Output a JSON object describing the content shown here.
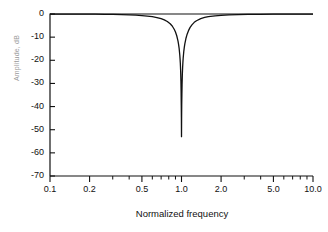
{
  "chart_data": {
    "type": "line",
    "title": "",
    "xlabel": "Normalized frequency",
    "ylabel": "Amplitude, dB",
    "xscale": "log",
    "yscale": "linear",
    "xlim": [
      0.1,
      10.0
    ],
    "ylim": [
      -70,
      0
    ],
    "grid": false,
    "legend": null,
    "xticks": [
      {
        "value": 0.1,
        "label": "0.1"
      },
      {
        "value": 0.2,
        "label": "0.2"
      },
      {
        "value": 0.5,
        "label": "0.5"
      },
      {
        "value": 1.0,
        "label": "1.0"
      },
      {
        "value": 2.0,
        "label": "2.0"
      },
      {
        "value": 5.0,
        "label": "5.0"
      },
      {
        "value": 10.0,
        "label": "10.0"
      }
    ],
    "xminor_ticks": [
      0.3,
      0.4,
      0.6,
      0.7,
      0.8,
      0.9,
      3.0,
      4.0,
      6.0,
      7.0,
      8.0,
      9.0
    ],
    "yticks": [
      {
        "value": 0,
        "label": "0"
      },
      {
        "value": -10,
        "label": "-10"
      },
      {
        "value": -20,
        "label": "-20"
      },
      {
        "value": -30,
        "label": "-30"
      },
      {
        "value": -40,
        "label": "-40"
      },
      {
        "value": -50,
        "label": "-50"
      },
      {
        "value": -60,
        "label": "-60"
      },
      {
        "value": -70,
        "label": "-70"
      }
    ],
    "series": [
      {
        "name": "Notch filter response",
        "color": "#111111",
        "x": [
          0.1,
          0.12,
          0.15,
          0.18,
          0.22,
          0.26,
          0.3,
          0.35,
          0.4,
          0.45,
          0.5,
          0.55,
          0.6,
          0.65,
          0.7,
          0.74,
          0.78,
          0.82,
          0.85,
          0.88,
          0.9,
          0.92,
          0.94,
          0.95,
          0.96,
          0.97,
          0.975,
          0.98,
          0.985,
          0.99,
          0.993,
          0.996,
          0.998,
          1.0,
          1.002,
          1.004,
          1.007,
          1.01,
          1.015,
          1.02,
          1.025,
          1.03,
          1.04,
          1.05,
          1.06,
          1.08,
          1.1,
          1.13,
          1.16,
          1.2,
          1.25,
          1.3,
          1.4,
          1.5,
          1.6,
          1.8,
          2.0,
          2.3,
          2.7,
          3.2,
          4.0,
          5.0,
          6.5,
          8.0,
          10.0
        ],
        "y": [
          -0.02,
          -0.03,
          -0.04,
          -0.06,
          -0.09,
          -0.13,
          -0.18,
          -0.26,
          -0.36,
          -0.49,
          -0.66,
          -0.88,
          -1.16,
          -1.53,
          -2.03,
          -2.55,
          -3.25,
          -4.21,
          -5.2,
          -6.6,
          -7.8,
          -9.4,
          -11.6,
          -13.1,
          -15.0,
          -17.6,
          -19.3,
          -21.5,
          -24.5,
          -29.0,
          -33.5,
          -39.5,
          -44.5,
          -53.0,
          -44.5,
          -39.0,
          -34.5,
          -30.5,
          -26.0,
          -23.0,
          -20.8,
          -19.0,
          -16.4,
          -14.4,
          -12.9,
          -10.6,
          -9.0,
          -7.2,
          -5.9,
          -4.7,
          -3.6,
          -2.9,
          -2.0,
          -1.5,
          -1.15,
          -0.78,
          -0.57,
          -0.39,
          -0.26,
          -0.18,
          -0.12,
          -0.08,
          -0.05,
          -0.03,
          -0.02
        ]
      }
    ],
    "annotations": [
      {
        "text": "notch depth",
        "value": -53,
        "at_x": 1.0
      }
    ]
  },
  "axis": {
    "x_title": "Normalized frequency",
    "y_title": "Amplitude, dB"
  }
}
